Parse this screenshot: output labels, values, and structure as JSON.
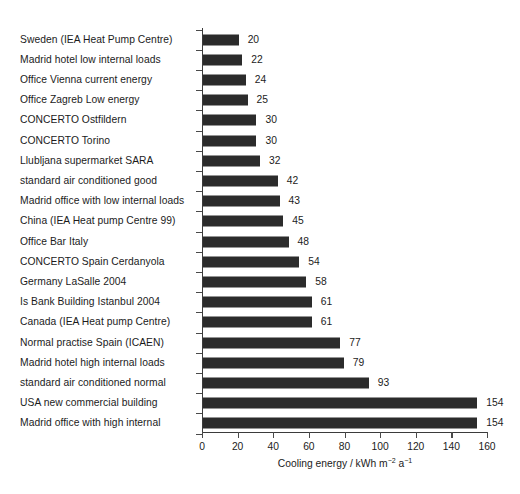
{
  "chart_data": {
    "type": "bar",
    "orientation": "horizontal",
    "title": "",
    "xlabel": "Cooling energy  / kWh m⁻² a⁻¹",
    "xlabel_parts": {
      "text_before": "Cooling energy  / kWh m",
      "sup_1": "-2",
      "text_middle": " a",
      "sup_2": "-1"
    },
    "ylabel": "",
    "xlim": [
      0,
      160
    ],
    "xticks": [
      0,
      20,
      40,
      60,
      80,
      100,
      120,
      140,
      160
    ],
    "xtick_labels": [
      "0",
      "20",
      "40",
      "60",
      "80",
      "100",
      "120",
      "140",
      "160"
    ],
    "grid": false,
    "legend": null,
    "bar_color": "#2b2b2b",
    "axis_color": "#3b3b3b",
    "background": "#ffffff",
    "value_labels_shown": true,
    "categories": [
      "Sweden (IEA Heat Pump Centre)",
      "Madrid hotel low internal loads",
      "Office Vienna current energy",
      "Office Zagreb Low energy",
      "CONCERTO Ostfildern",
      "CONCERTO Torino",
      "Llubljana supermarket SARA",
      "standard air conditioned good",
      "Madrid office with low internal loads",
      "China (IEA Heat pump Centre 99)",
      "Office Bar Italy",
      "CONCERTO Spain Cerdanyola",
      "Germany LaSalle 2004",
      "Is Bank Building Istanbul 2004",
      "Canada (IEA Heat pump Centre)",
      "Normal practise Spain (ICAEN)",
      "Madrid hotel high internal loads",
      "standard air conditioned normal",
      "USA new commercial building",
      "Madrid office with high internal"
    ],
    "values": [
      20,
      22,
      24,
      25,
      30,
      30,
      32,
      42,
      43,
      45,
      48,
      54,
      58,
      61,
      61,
      77,
      79,
      93,
      154,
      154
    ],
    "value_labels": [
      "20",
      "22",
      "24",
      "25",
      "30",
      "30",
      "32",
      "42",
      "43",
      "45",
      "48",
      "54",
      "58",
      "61",
      "61",
      "77",
      "79",
      "93",
      "154",
      "154"
    ]
  },
  "title_remnant": ""
}
